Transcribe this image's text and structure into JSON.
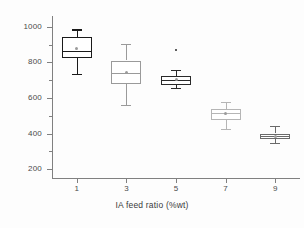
{
  "chart_data": {
    "type": "box",
    "title": "",
    "xlabel": "IA feed ratio (%wt)",
    "ylabel": "Nanofiber Diameter (nm)",
    "xlim": [
      0,
      10
    ],
    "ylim": [
      150,
      1060
    ],
    "ytick_values": [
      200,
      400,
      600,
      800,
      1000
    ],
    "ytick_labels": [
      "200",
      "400",
      "600",
      "800",
      "1000"
    ],
    "yminor_values": [
      300,
      500,
      700,
      900
    ],
    "xtick_values": [
      1,
      3,
      5,
      7,
      9
    ],
    "categories": [
      "1",
      "3",
      "5",
      "7",
      "9"
    ],
    "grid": false,
    "legend": false,
    "boxes": [
      {
        "category": "1",
        "x": 1,
        "whisker_low": 735,
        "q1": 825,
        "median": 864,
        "q3": 943,
        "whisker_high": 985,
        "mean": 875,
        "outliers": [],
        "edge_color": "#1a1a1a",
        "line_width": 1.4
      },
      {
        "category": "3",
        "x": 3,
        "whisker_low": 562,
        "q1": 678,
        "median": 740,
        "q3": 810,
        "whisker_high": 903,
        "mean": 745,
        "outliers": [],
        "edge_color": "#9a9a9a",
        "line_width": 1.0
      },
      {
        "category": "5",
        "x": 5,
        "whisker_low": 655,
        "q1": 675,
        "median": 703,
        "q3": 722,
        "whisker_high": 757,
        "mean": 705,
        "outliers": [
          869
        ],
        "edge_color": "#2a2a2a",
        "line_width": 1.3
      },
      {
        "category": "7",
        "x": 7,
        "whisker_low": 425,
        "q1": 478,
        "median": 515,
        "q3": 538,
        "whisker_high": 578,
        "mean": 512,
        "outliers": [],
        "edge_color": "#b5b5b5",
        "line_width": 1.0
      },
      {
        "category": "9",
        "x": 9,
        "whisker_low": 348,
        "q1": 372,
        "median": 385,
        "q3": 400,
        "whisker_high": 443,
        "mean": 386,
        "outliers": [],
        "edge_color": "#6a6a6a",
        "line_width": 1.2
      }
    ],
    "colors": {
      "axis": "#808080",
      "tick_label": "#4a4a4a",
      "axis_title": "#3a3a3a",
      "background": "#fdfdfd",
      "box_fill": "#ffffff"
    }
  }
}
